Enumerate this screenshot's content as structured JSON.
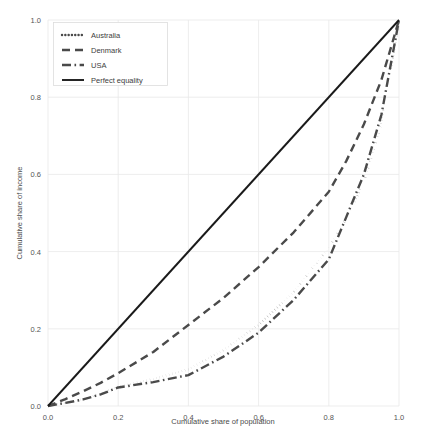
{
  "chart_data": {
    "type": "line",
    "title": "",
    "xlabel": "Cumulative share of population",
    "ylabel": "Cumulative share of income",
    "xlim": [
      0.0,
      1.0
    ],
    "ylim": [
      0.0,
      1.0
    ],
    "xticks": [
      "0.0",
      "0.2",
      "0.4",
      "0.6",
      "0.8",
      "1.0"
    ],
    "yticks": [
      "0.0",
      "0.2",
      "0.4",
      "0.6",
      "0.8",
      "1.0"
    ],
    "xtick_values": [
      0.0,
      0.2,
      0.4,
      0.6,
      0.8,
      1.0
    ],
    "ytick_values": [
      0.0,
      0.2,
      0.4,
      0.6,
      0.8,
      1.0
    ],
    "grid": true,
    "legend_position": "upper left",
    "series": [
      {
        "name": "Australia",
        "style": "dotted",
        "color": "#4a4a4a",
        "x": [
          0.0,
          0.05,
          0.1,
          0.15,
          0.2,
          0.3,
          0.4,
          0.5,
          0.6,
          0.7,
          0.8,
          0.85,
          0.9,
          0.95,
          1.0
        ],
        "y": [
          0.0,
          0.008,
          0.018,
          0.032,
          0.05,
          0.07,
          0.095,
          0.145,
          0.21,
          0.295,
          0.41,
          0.485,
          0.58,
          0.73,
          1.0
        ]
      },
      {
        "name": "Denmark",
        "style": "dashed",
        "color": "#4a4a4a",
        "x": [
          0.0,
          0.05,
          0.1,
          0.15,
          0.2,
          0.3,
          0.4,
          0.5,
          0.6,
          0.7,
          0.8,
          0.85,
          0.9,
          0.95,
          1.0
        ],
        "y": [
          0.0,
          0.018,
          0.038,
          0.06,
          0.085,
          0.14,
          0.21,
          0.28,
          0.36,
          0.45,
          0.555,
          0.635,
          0.73,
          0.845,
          1.0
        ]
      },
      {
        "name": "USA",
        "style": "dashdot",
        "color": "#4a4a4a",
        "x": [
          0.0,
          0.05,
          0.1,
          0.15,
          0.2,
          0.3,
          0.4,
          0.5,
          0.6,
          0.7,
          0.8,
          0.85,
          0.9,
          0.95,
          1.0
        ],
        "y": [
          0.0,
          0.008,
          0.017,
          0.03,
          0.048,
          0.062,
          0.08,
          0.128,
          0.19,
          0.275,
          0.38,
          0.49,
          0.6,
          0.755,
          1.0
        ]
      },
      {
        "name": "Perfect equality",
        "style": "solid",
        "color": "#1a1a1a",
        "x": [
          0.0,
          1.0
        ],
        "y": [
          0.0,
          1.0
        ]
      }
    ],
    "legend_entries": [
      {
        "label": "Australia",
        "style": "dotted"
      },
      {
        "label": "Denmark",
        "style": "dashed"
      },
      {
        "label": "USA",
        "style": "dashdot"
      },
      {
        "label": "Perfect equality",
        "style": "solid"
      }
    ]
  },
  "colors": {
    "background": "#ffffff",
    "grid": "#e9e9e9",
    "text": "#4d4d4d",
    "series_gray": "#4a4a4a",
    "series_black": "#1a1a1a",
    "legend_border": "#dcdcdc"
  }
}
